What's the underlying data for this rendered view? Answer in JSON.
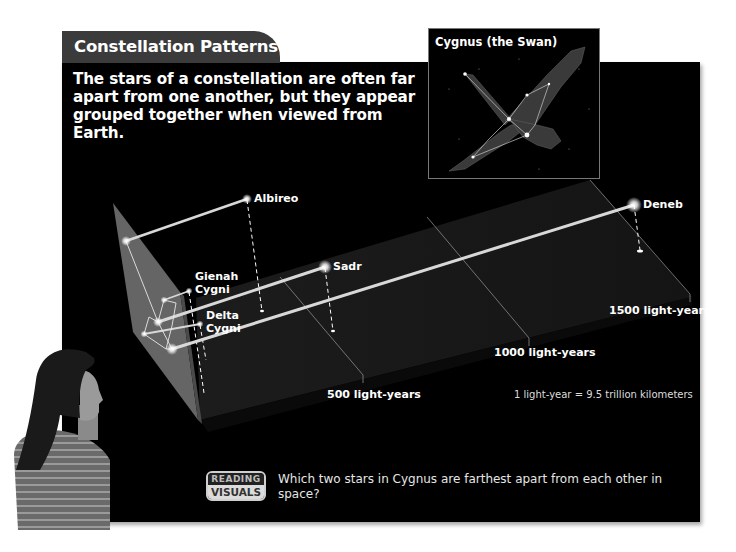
{
  "header": {
    "tab_title": "Constellation Patterns",
    "intro_text": "The stars of a constellation are often far apart from one another, but they appear grouped together when viewed from Earth."
  },
  "inset": {
    "title": "Cygnus (the Swan)"
  },
  "stars": [
    {
      "name": "Albireo"
    },
    {
      "name": "Sadr"
    },
    {
      "name": "Deneb"
    },
    {
      "name": "Gienah Cygni",
      "line1": "Gienah",
      "line2": "Cygni"
    },
    {
      "name": "Delta Cygni",
      "line1": "Delta",
      "line2": "Cygni"
    }
  ],
  "distance_markers": [
    {
      "label": "500 light-years"
    },
    {
      "label": "1000 light-years"
    },
    {
      "label": "1500 light-years"
    }
  ],
  "conversion_note": "1 light-year = 9.5 trillion kilometers",
  "reading_visuals": {
    "badge_top": "READING",
    "badge_bottom": "VISUALS",
    "question": "Which two stars in Cygnus are farthest apart from each other in space?"
  },
  "colors": {
    "panel_bg": "#000000",
    "tab_bg": "#3b3b3b",
    "projection_plane": "#6e6e6e",
    "distance_plane": "#161616",
    "text": "#ffffff"
  }
}
